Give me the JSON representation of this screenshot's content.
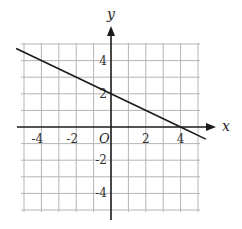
{
  "chart_data": {
    "type": "line",
    "title": "",
    "xlabel": "x",
    "ylabel": "y",
    "origin_label": "O",
    "xlim": [
      -5,
      5
    ],
    "ylim": [
      -5,
      5
    ],
    "grid": true,
    "grid_step": 1,
    "x_ticks": [
      -4,
      -2,
      2,
      4
    ],
    "y_ticks": [
      4,
      2,
      -2,
      -4
    ],
    "x_tick_labels": [
      "-4",
      "-2",
      "2",
      "4"
    ],
    "y_tick_labels": [
      "4",
      "2",
      "-2",
      "-4"
    ],
    "series": [
      {
        "name": "line",
        "equation": "y = -0.5x + 2",
        "slope": -0.5,
        "intercept": 2,
        "x": [
          -5.45,
          0,
          4,
          5.45
        ],
        "y": [
          4.73,
          2,
          0,
          -0.73
        ]
      }
    ],
    "legend": null,
    "colors": {
      "line": "#1a1a1a",
      "grid": "#b5b5b5",
      "axis": "#1a1a1a"
    }
  }
}
